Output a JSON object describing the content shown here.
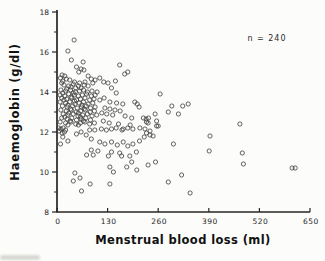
{
  "figure": {
    "annotation": "n = 240",
    "xlabel": "Menstrual blood loss (ml)",
    "ylabel": "Haemoglobin (g/dl)"
  },
  "chart_data": {
    "type": "scatter",
    "title": "",
    "xlabel": "Menstrual blood loss (ml)",
    "ylabel": "Haemoglobin (g/dl)",
    "annotation": "n = 240",
    "n": 240,
    "xlim": [
      0,
      650
    ],
    "ylim": [
      8,
      18
    ],
    "x_ticks": [
      0,
      130,
      260,
      390,
      520,
      650
    ],
    "y_ticks": [
      8,
      10,
      12,
      14,
      16,
      18
    ],
    "y_minor_ticks": [
      9,
      11,
      13,
      15,
      17
    ],
    "grid": false,
    "marker": {
      "shape": "open-circle",
      "color": "#3b3b3b",
      "radius": 2.1
    },
    "axis_color": "#262626",
    "points": [
      [
        44,
        16.6
      ],
      [
        28,
        16.05
      ],
      [
        37,
        15.6
      ],
      [
        67,
        15.5
      ],
      [
        50,
        15.25
      ],
      [
        62,
        15.15
      ],
      [
        69,
        15.1
      ],
      [
        56,
        15.0
      ],
      [
        13,
        14.85
      ],
      [
        9,
        14.7
      ],
      [
        20,
        14.8
      ],
      [
        24,
        14.65
      ],
      [
        15,
        14.55
      ],
      [
        33,
        14.6
      ],
      [
        80,
        14.8
      ],
      [
        88,
        14.65
      ],
      [
        98,
        14.6
      ],
      [
        110,
        14.7
      ],
      [
        161,
        15.35
      ],
      [
        174,
        14.9
      ],
      [
        182,
        15.0
      ],
      [
        150,
        14.55
      ],
      [
        120,
        14.5
      ],
      [
        131,
        14.45
      ],
      [
        45,
        14.5
      ],
      [
        58,
        14.45
      ],
      [
        12,
        14.45
      ],
      [
        72,
        14.5
      ],
      [
        92,
        14.45
      ],
      [
        18,
        14.35
      ],
      [
        30,
        14.3
      ],
      [
        42,
        14.4
      ],
      [
        55,
        14.3
      ],
      [
        70,
        14.35
      ],
      [
        36,
        14.25
      ],
      [
        62,
        14.2
      ],
      [
        48,
        14.2
      ],
      [
        25,
        14.15
      ],
      [
        80,
        14.3
      ],
      [
        10,
        14.1
      ],
      [
        22,
        14.05
      ],
      [
        35,
        14.1
      ],
      [
        47,
        14.0
      ],
      [
        58,
        14.05
      ],
      [
        68,
        14.1
      ],
      [
        78,
        14.0
      ],
      [
        90,
        14.05
      ],
      [
        15,
        13.95
      ],
      [
        42,
        13.95
      ],
      [
        103,
        14.0
      ],
      [
        8,
        13.85
      ],
      [
        20,
        13.8
      ],
      [
        30,
        13.9
      ],
      [
        44,
        13.85
      ],
      [
        55,
        13.8
      ],
      [
        65,
        13.85
      ],
      [
        76,
        13.9
      ],
      [
        88,
        13.8
      ],
      [
        98,
        13.85
      ],
      [
        36,
        13.75
      ],
      [
        12,
        13.7
      ],
      [
        25,
        13.65
      ],
      [
        38,
        13.7
      ],
      [
        50,
        13.6
      ],
      [
        60,
        13.65
      ],
      [
        72,
        13.7
      ],
      [
        84,
        13.6
      ],
      [
        95,
        13.65
      ],
      [
        18,
        13.6
      ],
      [
        45,
        13.55
      ],
      [
        8,
        13.5
      ],
      [
        22,
        13.45
      ],
      [
        33,
        13.5
      ],
      [
        46,
        13.4
      ],
      [
        57,
        13.45
      ],
      [
        68,
        13.5
      ],
      [
        80,
        13.4
      ],
      [
        92,
        13.45
      ],
      [
        28,
        13.35
      ],
      [
        64,
        13.35
      ],
      [
        14,
        13.3
      ],
      [
        26,
        13.25
      ],
      [
        40,
        13.3
      ],
      [
        52,
        13.2
      ],
      [
        63,
        13.25
      ],
      [
        75,
        13.3
      ],
      [
        86,
        13.2
      ],
      [
        98,
        13.25
      ],
      [
        35,
        13.15
      ],
      [
        70,
        13.15
      ],
      [
        10,
        13.1
      ],
      [
        24,
        13.05
      ],
      [
        37,
        13.1
      ],
      [
        49,
        13.0
      ],
      [
        61,
        13.05
      ],
      [
        73,
        13.1
      ],
      [
        85,
        13.0
      ],
      [
        96,
        13.05
      ],
      [
        30,
        12.95
      ],
      [
        55,
        12.95
      ],
      [
        16,
        12.9
      ],
      [
        28,
        12.85
      ],
      [
        42,
        12.9
      ],
      [
        54,
        12.8
      ],
      [
        66,
        12.85
      ],
      [
        78,
        12.9
      ],
      [
        90,
        12.8
      ],
      [
        102,
        12.85
      ],
      [
        20,
        12.75
      ],
      [
        60,
        12.75
      ],
      [
        12,
        12.7
      ],
      [
        26,
        12.65
      ],
      [
        38,
        12.7
      ],
      [
        50,
        12.6
      ],
      [
        62,
        12.65
      ],
      [
        74,
        12.7
      ],
      [
        86,
        12.6
      ],
      [
        34,
        12.55
      ],
      [
        68,
        12.55
      ],
      [
        8,
        12.5
      ],
      [
        22,
        12.45
      ],
      [
        36,
        12.5
      ],
      [
        48,
        12.4
      ],
      [
        60,
        12.45
      ],
      [
        72,
        12.5
      ],
      [
        84,
        12.4
      ],
      [
        96,
        12.45
      ],
      [
        28,
        12.35
      ],
      [
        55,
        12.35
      ],
      [
        140,
        14.2
      ],
      [
        152,
        13.95
      ],
      [
        121,
        13.7
      ],
      [
        110,
        13.6
      ],
      [
        136,
        13.5
      ],
      [
        153,
        13.45
      ],
      [
        169,
        13.4
      ],
      [
        200,
        13.5
      ],
      [
        206,
        13.4
      ],
      [
        211,
        13.25
      ],
      [
        123,
        13.2
      ],
      [
        136,
        13.15
      ],
      [
        149,
        13.1
      ],
      [
        162,
        13.05
      ],
      [
        115,
        12.95
      ],
      [
        128,
        12.9
      ],
      [
        143,
        12.85
      ],
      [
        175,
        12.8
      ],
      [
        192,
        12.7
      ],
      [
        222,
        12.7
      ],
      [
        229,
        12.65
      ],
      [
        119,
        12.55
      ],
      [
        134,
        12.45
      ],
      [
        158,
        12.4
      ],
      [
        188,
        12.35
      ],
      [
        213,
        12.2
      ],
      [
        226,
        12.15
      ],
      [
        170,
        12.15
      ],
      [
        4,
        12.2
      ],
      [
        10,
        12.15
      ],
      [
        16,
        12.2
      ],
      [
        22,
        12.1
      ],
      [
        6,
        12.05
      ],
      [
        13,
        11.95
      ],
      [
        19,
        12.0
      ],
      [
        15,
        11.75
      ],
      [
        28,
        11.55
      ],
      [
        9,
        11.4
      ],
      [
        50,
        11.9
      ],
      [
        62,
        12.0
      ],
      [
        75,
        11.85
      ],
      [
        84,
        12.1
      ],
      [
        97,
        12.1
      ],
      [
        114,
        12.15
      ],
      [
        127,
        12.1
      ],
      [
        140,
        12.15
      ],
      [
        152,
        12.2
      ],
      [
        167,
        12.1
      ],
      [
        182,
        12.2
      ],
      [
        195,
        12.15
      ],
      [
        88,
        11.65
      ],
      [
        110,
        11.5
      ],
      [
        123,
        11.4
      ],
      [
        140,
        11.5
      ],
      [
        155,
        11.35
      ],
      [
        170,
        11.5
      ],
      [
        182,
        11.3
      ],
      [
        195,
        11.4
      ],
      [
        212,
        11.55
      ],
      [
        224,
        11.75
      ],
      [
        88,
        11.1
      ],
      [
        105,
        11.05
      ],
      [
        140,
        11.0
      ],
      [
        161,
        10.95
      ],
      [
        187,
        10.8
      ],
      [
        204,
        11.0
      ],
      [
        76,
        10.85
      ],
      [
        93,
        10.85
      ],
      [
        132,
        10.8
      ],
      [
        166,
        10.8
      ],
      [
        192,
        10.5
      ],
      [
        179,
        10.25
      ],
      [
        205,
        10.1
      ],
      [
        136,
        10.25
      ],
      [
        145,
        10.0
      ],
      [
        46,
        9.95
      ],
      [
        59,
        9.7
      ],
      [
        42,
        9.55
      ],
      [
        85,
        9.4
      ],
      [
        63,
        9.05
      ],
      [
        136,
        9.4
      ],
      [
        265,
        13.9
      ],
      [
        295,
        13.3
      ],
      [
        337,
        13.4
      ],
      [
        323,
        13.3
      ],
      [
        286,
        13.0
      ],
      [
        312,
        12.9
      ],
      [
        235,
        12.7
      ],
      [
        252,
        12.9
      ],
      [
        230,
        12.5
      ],
      [
        256,
        12.55
      ],
      [
        260,
        12.3
      ],
      [
        239,
        12.05
      ],
      [
        230,
        11.95
      ],
      [
        247,
        11.8
      ],
      [
        234,
        12.45
      ],
      [
        256,
        12.3
      ],
      [
        239,
        11.85
      ],
      [
        299,
        11.4
      ],
      [
        253,
        10.5
      ],
      [
        234,
        10.35
      ],
      [
        320,
        9.85
      ],
      [
        286,
        9.5
      ],
      [
        342,
        8.95
      ],
      [
        393,
        11.8
      ],
      [
        391,
        11.05
      ],
      [
        470,
        12.4
      ],
      [
        476,
        10.95
      ],
      [
        479,
        10.4
      ],
      [
        604,
        10.2
      ],
      [
        612,
        10.2
      ]
    ]
  }
}
